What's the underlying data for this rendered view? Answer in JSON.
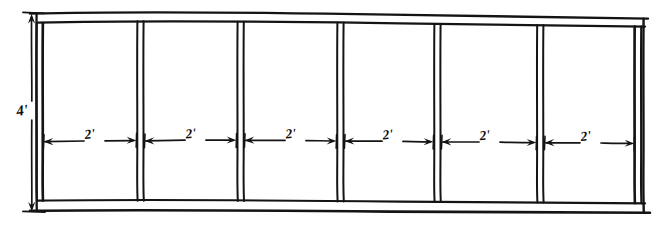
{
  "diagram": {
    "type": "hand-drawn engineering elevation",
    "style": "pencil / ink freehand line drawing",
    "background_color": "#ffffff",
    "line_color": "#141414",
    "height_dimension": {
      "label": "4'",
      "value": 4,
      "unit": "feet",
      "orientation": "vertical",
      "position": "left side",
      "arrow_style": "double-headed"
    },
    "bay_dimensions": [
      {
        "index": 1,
        "label": "2'",
        "value": 2,
        "unit": "feet"
      },
      {
        "index": 2,
        "label": "2'",
        "value": 2,
        "unit": "feet"
      },
      {
        "index": 3,
        "label": "2'",
        "value": 2,
        "unit": "feet"
      },
      {
        "index": 4,
        "label": "2'",
        "value": 2,
        "unit": "feet"
      },
      {
        "index": 5,
        "label": "2'",
        "value": 2,
        "unit": "feet"
      },
      {
        "index": 6,
        "label": "2'",
        "value": 2,
        "unit": "feet"
      }
    ],
    "bay_count": 6,
    "mullion_count": 7,
    "total_width_label": "12'",
    "geometry": {
      "frame_outer": {
        "x1": 36,
        "y1": 13,
        "x2": 643,
        "y2": 210
      },
      "frame_inner": {
        "x1": 42,
        "y1": 22,
        "x2": 634,
        "y2": 201
      },
      "mullion_x": [
        39,
        140,
        240,
        340,
        437,
        540,
        638
      ],
      "dim_line_y": 141,
      "vert_dim_x": 32
    }
  }
}
